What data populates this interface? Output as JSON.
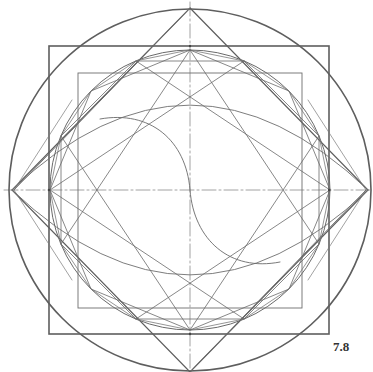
{
  "figure": {
    "label": "7.8",
    "center": [
      190,
      190
    ],
    "stroke_color": "#5a5a5a",
    "thin_stroke_color": "#6e6e6e",
    "axis_color": "#888888",
    "outer_circle_r": 181,
    "inner_circle_r": 140,
    "outer_square": {
      "x": 49,
      "y": 46,
      "w": 280,
      "h": 288
    },
    "inner_square": {
      "x": 78,
      "y": 73,
      "w": 224,
      "h": 235
    },
    "diamond": [
      [
        190,
        8
      ],
      [
        368,
        190
      ],
      [
        190,
        372
      ],
      [
        12,
        190
      ]
    ],
    "elements": [
      "outer-circle",
      "outer-square",
      "diamond",
      "inner-circle",
      "inner-square",
      "octagram-lines",
      "lens-arcs",
      "s-curve",
      "center-axes"
    ]
  }
}
